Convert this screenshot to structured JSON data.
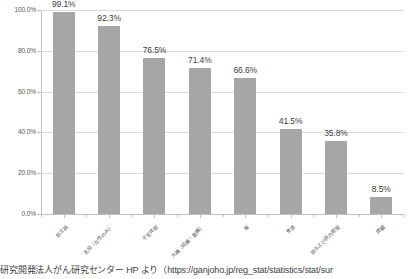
{
  "chart_data": {
    "type": "bar",
    "title": "",
    "subtitle": "",
    "xlabel": "",
    "ylabel": "",
    "ylim": [
      0,
      100
    ],
    "ytick_labels": [
      "100.0%",
      "80.0%",
      "60.0%",
      "40.0%",
      "20.0%",
      "0.0%"
    ],
    "ytick_values": [
      100,
      80,
      60,
      40,
      20,
      0
    ],
    "grid": true,
    "legend": "none",
    "categories": [
      "前立腺",
      "乳房（女性のみ）",
      "子宮体部",
      "大腸（結腸・直腸）",
      "胃",
      "食道",
      "肝および肝内胆管",
      "膵臓"
    ],
    "values": [
      99.1,
      92.3,
      76.5,
      71.4,
      66.6,
      41.5,
      35.8,
      8.5
    ],
    "value_labels": [
      "99.1%",
      "92.3%",
      "76.5%",
      "71.4%",
      "66.6%",
      "41.5%",
      "35.8%",
      "8.5%"
    ],
    "bar_color": "#a6a6a6",
    "grid_color": "#d9d9d9",
    "axis_color": "#bfbfbf",
    "text_color": "#404040"
  },
  "caption": {
    "text": "研究開発法人がん研究センター HP より（https://ganjoho.jp/reg_stat/statistics/stat/sur"
  }
}
